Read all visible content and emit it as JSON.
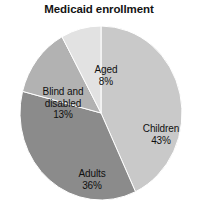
{
  "chart_data": {
    "type": "pie",
    "title": "Medicaid enrollment",
    "xlabel": "",
    "ylabel": "",
    "legend": "none (labels placed inside slices)",
    "grid": false,
    "start_angle_deg": 0,
    "direction": "clockwise",
    "categories": [
      "Children",
      "Adults",
      "Blind and disabled",
      "Aged"
    ],
    "values": [
      43,
      36,
      13,
      8
    ],
    "value_unit": "percent",
    "slices": [
      {
        "name": "Children",
        "value": 43,
        "label": "Children",
        "percent_label": "43%",
        "color": "#c9c9c9",
        "start_deg": 0,
        "end_deg": 154.8
      },
      {
        "name": "Adults",
        "value": 36,
        "label": "Adults",
        "percent_label": "36%",
        "color": "#8b8b8b",
        "start_deg": 154.8,
        "end_deg": 284.4
      },
      {
        "name": "Blind and disabled",
        "value": 13,
        "label": "Blind and disabled",
        "percent_label": "13%",
        "color": "#b2b2b2",
        "start_deg": 284.4,
        "end_deg": 331.2
      },
      {
        "name": "Aged",
        "value": 8,
        "label": "Aged",
        "percent_label": "8%",
        "color": "#e2e2e2",
        "start_deg": 331.2,
        "end_deg": 360
      }
    ]
  },
  "colors": {
    "background": "#ffffff",
    "text": "#101010",
    "title": "#141414",
    "slice_children": "#c9c9c9",
    "slice_adults": "#8b8b8b",
    "slice_blind_disabled": "#b2b2b2",
    "slice_aged": "#e2e2e2",
    "slice_outline": "#ffffff"
  }
}
